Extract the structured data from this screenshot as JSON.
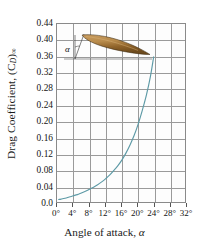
{
  "chart_data": {
    "type": "line",
    "title": "",
    "xlabel": "Angle of attack, α",
    "ylabel": "Drag Coefficient, (C_D)_∞",
    "ylabel_main": "Drag Coefficient, (C",
    "ylabel_sub": "D",
    "ylabel_close": ")",
    "ylabel_sub2": "∞",
    "xlabel_main": "Angle of attack, ",
    "xlabel_sym": "α",
    "xlim": [
      0,
      32
    ],
    "ylim": [
      0.0,
      0.44
    ],
    "grid": true,
    "legend": "none",
    "xtick_labels": [
      "0°",
      "4°",
      "8°",
      "12°",
      "16°",
      "20°",
      "24°",
      "28°",
      "32°"
    ],
    "xtick_values": [
      0,
      4,
      8,
      12,
      16,
      20,
      24,
      28,
      32
    ],
    "ytick_labels": [
      "0.44",
      "0.40",
      "0.36",
      "0.32",
      "0.28",
      "0.24",
      "0.20",
      "0.16",
      "0.12",
      "0.08",
      "0.04",
      "0.0"
    ],
    "ytick_values": [
      0.44,
      0.4,
      0.36,
      0.32,
      0.28,
      0.24,
      0.2,
      0.16,
      0.12,
      0.08,
      0.04,
      0.0
    ],
    "series": [
      {
        "name": "Drag coefficient curve",
        "color": "#5d9aa6",
        "x": [
          0.4,
          1,
          2,
          3,
          4,
          5,
          6,
          7,
          8,
          9,
          10,
          11,
          12,
          13,
          14,
          15,
          16,
          17,
          18,
          19,
          20,
          21,
          22,
          23,
          23.8
        ],
        "y": [
          0.011,
          0.012,
          0.014,
          0.017,
          0.02,
          0.023,
          0.027,
          0.031,
          0.036,
          0.041,
          0.047,
          0.054,
          0.062,
          0.071,
          0.082,
          0.094,
          0.108,
          0.125,
          0.145,
          0.168,
          0.196,
          0.229,
          0.266,
          0.312,
          0.36
        ]
      }
    ],
    "annotations": [
      {
        "name": "airfoil-inset",
        "alpha_label": "α",
        "airfoil_fill_top": "#b7894e",
        "airfoil_fill_bottom": "#7a5322",
        "airfoil_outline": "#3a2a12"
      }
    ],
    "colors": {
      "curve": "#5d9aa6",
      "grid": "#9a9a9a",
      "frame": "#8a8a8a",
      "text": "#141414",
      "airfoil_light": "#b7894e",
      "airfoil_dark": "#7a5322"
    }
  }
}
